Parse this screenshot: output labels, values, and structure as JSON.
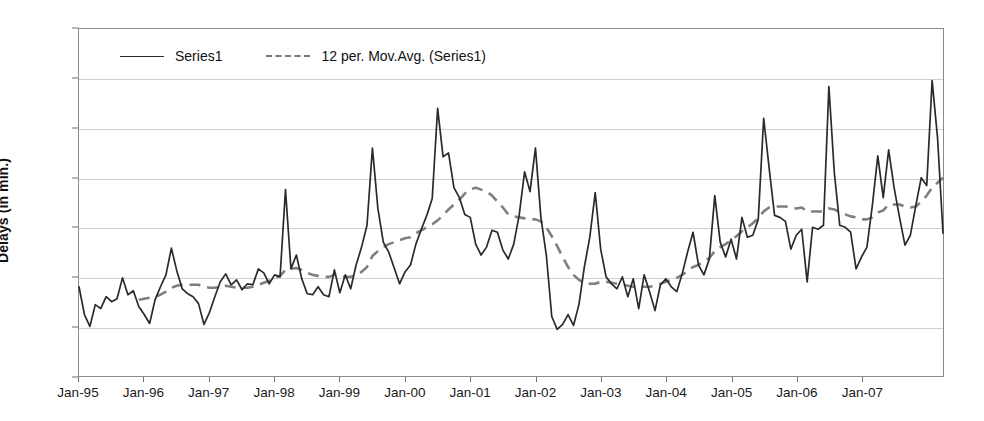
{
  "chart_data": {
    "type": "line",
    "title": "",
    "xlabel": "",
    "ylabel": "Delays (in min.)",
    "grid": true,
    "legend_position": "top-left-inside",
    "ylim": [
      0,
      3.5
    ],
    "ytick_labels": [
      "3.0",
      "3",
      "2.5",
      "2",
      "1.5",
      "1",
      "0.5",
      "0"
    ],
    "ytick_values": [
      3.5,
      3.0,
      2.5,
      2.0,
      1.5,
      1.0,
      0.5,
      0.0
    ],
    "xtick_labels": [
      "Jan-95",
      "Jan-96",
      "Jan-97",
      "Jan-98",
      "Jan-99",
      "Jan-00",
      "Jan-01",
      "Jan-02",
      "Jan-03",
      "Jan-04",
      "Jan-05",
      "Jan-06",
      "Jan-07"
    ],
    "x_start_label": "Jan-95",
    "x_end_label": "Jan-08",
    "x_points_per_tick": 12,
    "series": [
      {
        "name": "Series1",
        "style": "solid",
        "color": "#2a2a2a",
        "values": [
          0.9,
          0.62,
          0.5,
          0.72,
          0.68,
          0.8,
          0.75,
          0.78,
          0.99,
          0.82,
          0.86,
          0.7,
          0.62,
          0.53,
          0.77,
          0.9,
          1.02,
          1.29,
          1.06,
          0.88,
          0.83,
          0.8,
          0.73,
          0.52,
          0.64,
          0.8,
          0.95,
          1.03,
          0.92,
          0.97,
          0.87,
          0.93,
          0.92,
          1.08,
          1.04,
          0.93,
          1.02,
          1.0,
          1.88,
          1.08,
          1.22,
          0.98,
          0.83,
          0.82,
          0.9,
          0.82,
          0.8,
          1.07,
          0.84,
          1.02,
          0.88,
          1.12,
          1.3,
          1.52,
          2.3,
          1.69,
          1.35,
          1.25,
          1.09,
          0.93,
          1.05,
          1.12,
          1.33,
          1.48,
          1.62,
          1.79,
          2.7,
          2.21,
          2.25,
          1.9,
          1.8,
          1.63,
          1.6,
          1.33,
          1.22,
          1.3,
          1.47,
          1.45,
          1.27,
          1.18,
          1.33,
          1.62,
          2.06,
          1.86,
          2.3,
          1.6,
          1.22,
          0.6,
          0.47,
          0.52,
          0.62,
          0.51,
          0.72,
          1.1,
          1.4,
          1.85,
          1.28,
          1.0,
          0.93,
          0.88,
          1.0,
          0.8,
          0.98,
          0.68,
          1.02,
          0.85,
          0.66,
          0.92,
          0.98,
          0.9,
          0.85,
          1.03,
          1.25,
          1.45,
          1.12,
          1.02,
          1.18,
          1.82,
          1.35,
          1.2,
          1.38,
          1.18,
          1.6,
          1.4,
          1.42,
          1.58,
          2.6,
          2.1,
          1.62,
          1.6,
          1.56,
          1.28,
          1.42,
          1.48,
          0.95,
          1.5,
          1.48,
          1.52,
          2.92,
          2.05,
          1.52,
          1.5,
          1.45,
          1.08,
          1.2,
          1.3,
          1.72,
          2.22,
          1.8,
          2.28,
          1.9,
          1.6,
          1.32,
          1.42,
          1.72,
          2.0,
          1.92,
          2.98,
          2.4,
          1.44
        ]
      },
      {
        "name": "12 per. Mov.Avg. (Series1)",
        "style": "dashed",
        "color": "#7f7f7f",
        "values": [
          null,
          null,
          null,
          null,
          null,
          null,
          null,
          null,
          null,
          null,
          null,
          0.77,
          0.78,
          0.79,
          0.8,
          0.82,
          0.85,
          0.89,
          0.91,
          0.92,
          0.92,
          0.92,
          0.92,
          0.9,
          0.89,
          0.89,
          0.9,
          0.91,
          0.9,
          0.89,
          0.89,
          0.89,
          0.9,
          0.92,
          0.94,
          0.96,
          0.99,
          1.01,
          1.07,
          1.08,
          1.09,
          1.07,
          1.04,
          1.02,
          1.01,
          1.0,
          1.0,
          1.02,
          1.0,
          1.0,
          1.0,
          1.02,
          1.05,
          1.1,
          1.21,
          1.26,
          1.3,
          1.33,
          1.35,
          1.37,
          1.39,
          1.4,
          1.44,
          1.47,
          1.5,
          1.53,
          1.57,
          1.62,
          1.68,
          1.73,
          1.78,
          1.84,
          1.88,
          1.9,
          1.88,
          1.86,
          1.82,
          1.76,
          1.7,
          1.63,
          1.61,
          1.6,
          1.59,
          1.58,
          1.58,
          1.56,
          1.5,
          1.41,
          1.31,
          1.2,
          1.1,
          1.02,
          0.97,
          0.94,
          0.93,
          0.93,
          0.95,
          0.95,
          0.94,
          0.93,
          0.92,
          0.91,
          0.9,
          0.9,
          0.9,
          0.9,
          0.91,
          0.93,
          0.95,
          0.97,
          0.99,
          1.02,
          1.06,
          1.1,
          1.12,
          1.16,
          1.19,
          1.26,
          1.3,
          1.33,
          1.37,
          1.41,
          1.46,
          1.5,
          1.54,
          1.59,
          1.66,
          1.7,
          1.71,
          1.71,
          1.71,
          1.7,
          1.69,
          1.7,
          1.66,
          1.66,
          1.66,
          1.66,
          1.69,
          1.68,
          1.65,
          1.63,
          1.61,
          1.6,
          1.58,
          1.58,
          1.6,
          1.65,
          1.67,
          1.73,
          1.73,
          1.73,
          1.71,
          1.7,
          1.71,
          1.76,
          1.82,
          1.9,
          1.95,
          2.0
        ]
      }
    ]
  },
  "legend": {
    "entries": [
      {
        "label": "Series1"
      },
      {
        "label": "12 per. Mov.Avg. (Series1)"
      }
    ]
  },
  "axes": {
    "y_title": "Delays (in min.)"
  }
}
